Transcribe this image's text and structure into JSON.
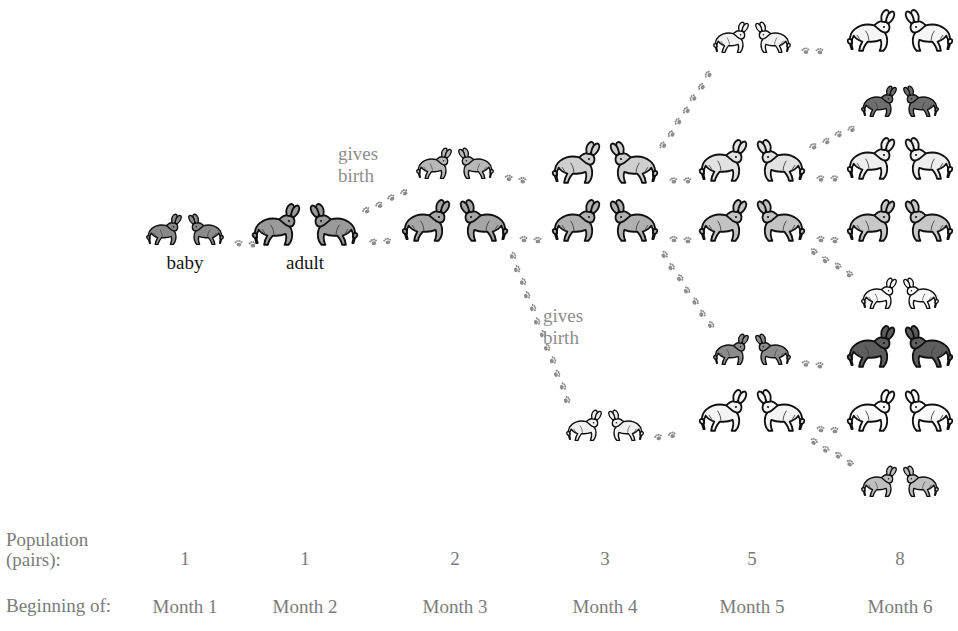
{
  "figure": {
    "background_color": "#ffffff",
    "label_color": "#7b7b7b",
    "birth_label_color": "#8e8e8e",
    "tag_color": "#151515"
  },
  "legend_tags": [
    {
      "label": "baby",
      "x": 185,
      "y": 252
    },
    {
      "label": "adult",
      "x": 305,
      "y": 252
    }
  ],
  "birth_labels": [
    {
      "text_line1": "gives",
      "text_line2": "birth",
      "x": 338,
      "y": 143
    },
    {
      "text_line1": "gives",
      "text_line2": "birth",
      "x": 543,
      "y": 305
    }
  ],
  "axis": {
    "population_label_line1": "Population",
    "population_label_line2": "(pairs):",
    "beginning_label": "Beginning of:",
    "population_values": [
      "1",
      "1",
      "2",
      "3",
      "5",
      "8"
    ],
    "months": [
      "Month 1",
      "Month 2",
      "Month 3",
      "Month 4",
      "Month 5",
      "Month 6"
    ],
    "population_row_y": 548,
    "month_row_y": 596
  },
  "columns_x": [
    185,
    305,
    455,
    605,
    752,
    900
  ],
  "chart_data": {
    "type": "diagram",
    "categories": [
      "Month 1",
      "Month 2",
      "Month 3",
      "Month 4",
      "Month 5",
      "Month 6"
    ],
    "values": [
      1,
      1,
      2,
      3,
      5,
      8
    ],
    "ylabel": "Population (pairs)",
    "xlabel": "Beginning of"
  },
  "pairs": [
    {
      "id": "c1p1",
      "col": 0,
      "x": 185,
      "y": 232,
      "stage": "baby",
      "shade": "#8a8a8a"
    },
    {
      "id": "c2p1",
      "col": 1,
      "x": 305,
      "y": 228,
      "stage": "adult",
      "shade": "#9a9a9a"
    },
    {
      "id": "c3p1",
      "col": 2,
      "x": 455,
      "y": 166,
      "stage": "baby",
      "shade": "#b8b8b8"
    },
    {
      "id": "c3p2",
      "col": 2,
      "x": 455,
      "y": 224,
      "stage": "adult",
      "shade": "#a6a6a6"
    },
    {
      "id": "c4p1",
      "col": 3,
      "x": 605,
      "y": 166,
      "stage": "adult",
      "shade": "#cfcfcf"
    },
    {
      "id": "c4p2",
      "col": 3,
      "x": 605,
      "y": 224,
      "stage": "adult",
      "shade": "#b0b0b0"
    },
    {
      "id": "c4p3",
      "col": 3,
      "x": 605,
      "y": 428,
      "stage": "baby",
      "shade": "#f0f0f0"
    },
    {
      "id": "c5p1",
      "col": 4,
      "x": 752,
      "y": 40,
      "stage": "baby",
      "shade": "#f2f2f2"
    },
    {
      "id": "c5p2",
      "col": 4,
      "x": 752,
      "y": 164,
      "stage": "adult",
      "shade": "#e2e2e2"
    },
    {
      "id": "c5p3",
      "col": 4,
      "x": 752,
      "y": 224,
      "stage": "adult",
      "shade": "#c3c3c3"
    },
    {
      "id": "c5p4",
      "col": 4,
      "x": 752,
      "y": 352,
      "stage": "baby",
      "shade": "#8c8c8c"
    },
    {
      "id": "c5p5",
      "col": 4,
      "x": 752,
      "y": 414,
      "stage": "adult",
      "shade": "#f4f4f4"
    },
    {
      "id": "c6p1",
      "col": 5,
      "x": 900,
      "y": 34,
      "stage": "adult",
      "shade": "#f6f6f6"
    },
    {
      "id": "c6p2",
      "col": 5,
      "x": 900,
      "y": 104,
      "stage": "baby",
      "shade": "#6e6e6e"
    },
    {
      "id": "c6p3",
      "col": 5,
      "x": 900,
      "y": 162,
      "stage": "adult",
      "shade": "#ededed"
    },
    {
      "id": "c6p4",
      "col": 5,
      "x": 900,
      "y": 224,
      "stage": "adult",
      "shade": "#c8c8c8"
    },
    {
      "id": "c6p5",
      "col": 5,
      "x": 900,
      "y": 296,
      "stage": "baby",
      "shade": "#fbfbfb"
    },
    {
      "id": "c6p6",
      "col": 5,
      "x": 900,
      "y": 350,
      "stage": "adult",
      "shade": "#5e5e5e"
    },
    {
      "id": "c6p7",
      "col": 5,
      "x": 900,
      "y": 414,
      "stage": "adult",
      "shade": "#fbfbfb"
    },
    {
      "id": "c6p8",
      "col": 5,
      "x": 900,
      "y": 484,
      "stage": "baby",
      "shade": "#c0c0c0"
    }
  ],
  "trails": [
    {
      "id": "t1",
      "kind": "grow",
      "from": "c1p1",
      "to": "c2p1"
    },
    {
      "id": "t2",
      "kind": "grow",
      "from": "c2p1",
      "to": "c3p2"
    },
    {
      "id": "t3",
      "kind": "birth",
      "from": "c2p1",
      "to": "c3p1"
    },
    {
      "id": "t4",
      "kind": "grow",
      "from": "c3p1",
      "to": "c4p1"
    },
    {
      "id": "t5",
      "kind": "grow",
      "from": "c3p2",
      "to": "c4p2"
    },
    {
      "id": "t6",
      "kind": "birth",
      "from": "c3p2",
      "to": "c4p3"
    },
    {
      "id": "t7",
      "kind": "birth",
      "from": "c4p1",
      "to": "c5p1"
    },
    {
      "id": "t8",
      "kind": "grow",
      "from": "c4p1",
      "to": "c5p2"
    },
    {
      "id": "t9",
      "kind": "grow",
      "from": "c4p2",
      "to": "c5p3"
    },
    {
      "id": "t10",
      "kind": "birth",
      "from": "c4p2",
      "to": "c5p4"
    },
    {
      "id": "t11",
      "kind": "grow",
      "from": "c4p3",
      "to": "c5p5"
    },
    {
      "id": "t12",
      "kind": "grow",
      "from": "c5p1",
      "to": "c6p1"
    },
    {
      "id": "t13",
      "kind": "birth",
      "from": "c5p2",
      "to": "c6p2"
    },
    {
      "id": "t14",
      "kind": "grow",
      "from": "c5p2",
      "to": "c6p3"
    },
    {
      "id": "t15",
      "kind": "grow",
      "from": "c5p3",
      "to": "c6p4"
    },
    {
      "id": "t16",
      "kind": "birth",
      "from": "c5p3",
      "to": "c6p5"
    },
    {
      "id": "t17",
      "kind": "grow",
      "from": "c5p4",
      "to": "c6p6"
    },
    {
      "id": "t18",
      "kind": "grow",
      "from": "c5p5",
      "to": "c6p7"
    },
    {
      "id": "t19",
      "kind": "birth",
      "from": "c5p5",
      "to": "c6p8"
    }
  ]
}
